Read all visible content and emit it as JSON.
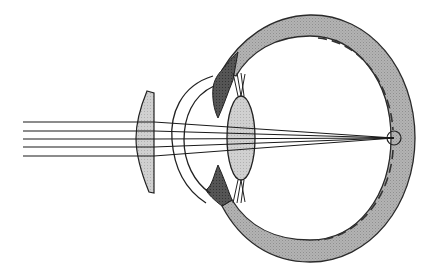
{
  "diagram": {
    "colors": {
      "background": "#ffffff",
      "sclera": "#a9a9a9",
      "iris": "#4a4a4a",
      "crystalline_lens": "#c8c8c8",
      "corrective_lens": "#bdbdbd",
      "stroke": "#222222"
    },
    "elements": [
      {
        "name": "incident-light-rays",
        "count": 5
      },
      {
        "name": "corrective-convex-lens"
      },
      {
        "name": "cornea"
      },
      {
        "name": "iris"
      },
      {
        "name": "crystalline-lens"
      },
      {
        "name": "ciliary-zonules"
      },
      {
        "name": "sclera-eyeball-wall"
      },
      {
        "name": "retina-dashed"
      },
      {
        "name": "focal-point-circle"
      }
    ]
  }
}
